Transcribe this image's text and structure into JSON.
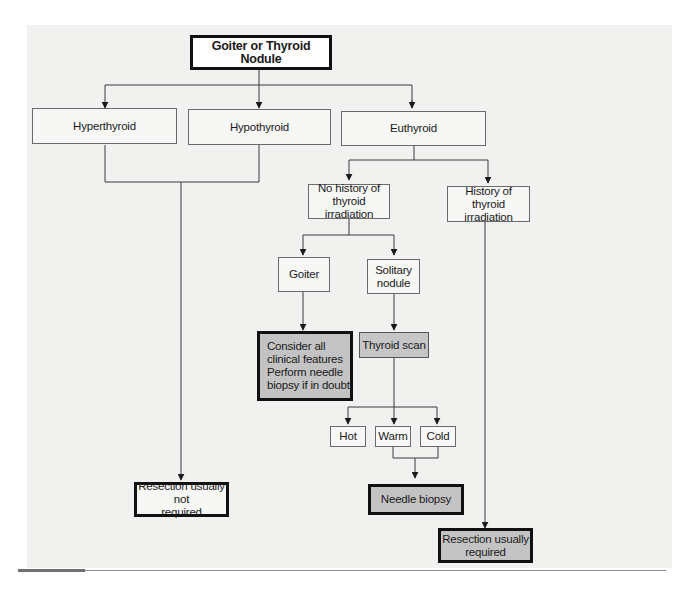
{
  "diagram": {
    "title": "Goiter or Thyroid Nodule",
    "nodes": {
      "root": "Goiter or Thyroid Nodule",
      "hyperthyroid": "Hyperthyroid",
      "hypothyroid": "Hypothyroid",
      "euthyroid": "Euthyroid",
      "no_history": "No history of\nthyroid irradiation",
      "history": "History of thyroid\nirradiation",
      "goiter": "Goiter",
      "solitary": "Solitary\nnodule",
      "consider": "Consider all\n    clinical features\nPerform needle\n    biopsy if in doubt",
      "scan": "Thyroid scan",
      "hot": "Hot",
      "warm": "Warm",
      "cold": "Cold",
      "needle": "Needle biopsy",
      "resect_not": "Resection usually not\nrequired",
      "resect_req": "Resection usually\nrequired"
    },
    "edges": [
      [
        "root",
        "hyperthyroid"
      ],
      [
        "root",
        "hypothyroid"
      ],
      [
        "root",
        "euthyroid"
      ],
      [
        "hyperthyroid",
        "resect_not"
      ],
      [
        "hypothyroid",
        "resect_not"
      ],
      [
        "euthyroid",
        "no_history"
      ],
      [
        "euthyroid",
        "history"
      ],
      [
        "no_history",
        "goiter"
      ],
      [
        "no_history",
        "solitary"
      ],
      [
        "goiter",
        "consider"
      ],
      [
        "solitary",
        "scan"
      ],
      [
        "scan",
        "hot"
      ],
      [
        "scan",
        "warm"
      ],
      [
        "scan",
        "cold"
      ],
      [
        "warm",
        "needle"
      ],
      [
        "cold",
        "needle"
      ],
      [
        "history",
        "resect_req"
      ]
    ],
    "colors": {
      "panel": "#f1f1f0",
      "shaded_box": "#c4c4c4",
      "line": "#3a3a3a"
    }
  }
}
